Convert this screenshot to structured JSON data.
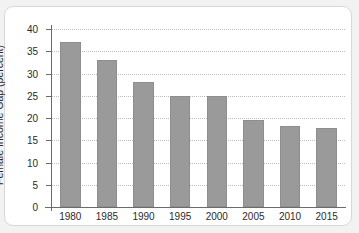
{
  "chart_data": {
    "type": "bar",
    "title": "",
    "xlabel": "",
    "ylabel": "Female Income Gap (percent)",
    "categories": [
      "1980",
      "1985",
      "1990",
      "1995",
      "2000",
      "2005",
      "2010",
      "2015"
    ],
    "values": [
      37,
      33,
      28,
      25,
      25,
      19.5,
      18.2,
      17.7
    ],
    "ylim": [
      0,
      40
    ],
    "ytick_labels": [
      "0",
      "5",
      "10",
      "15",
      "20",
      "25",
      "30",
      "35",
      "40"
    ],
    "ytick_values": [
      0,
      5,
      10,
      15,
      20,
      25,
      30,
      35,
      40
    ],
    "grid": "horizontal-dotted",
    "legend": "none",
    "bar_color": "#9a9a9a",
    "background_color": "#ffffff",
    "figure_background_color": "#f2f2f2",
    "axis_color": "#6b6b6b",
    "gridline_color": "#bdbdbd"
  }
}
